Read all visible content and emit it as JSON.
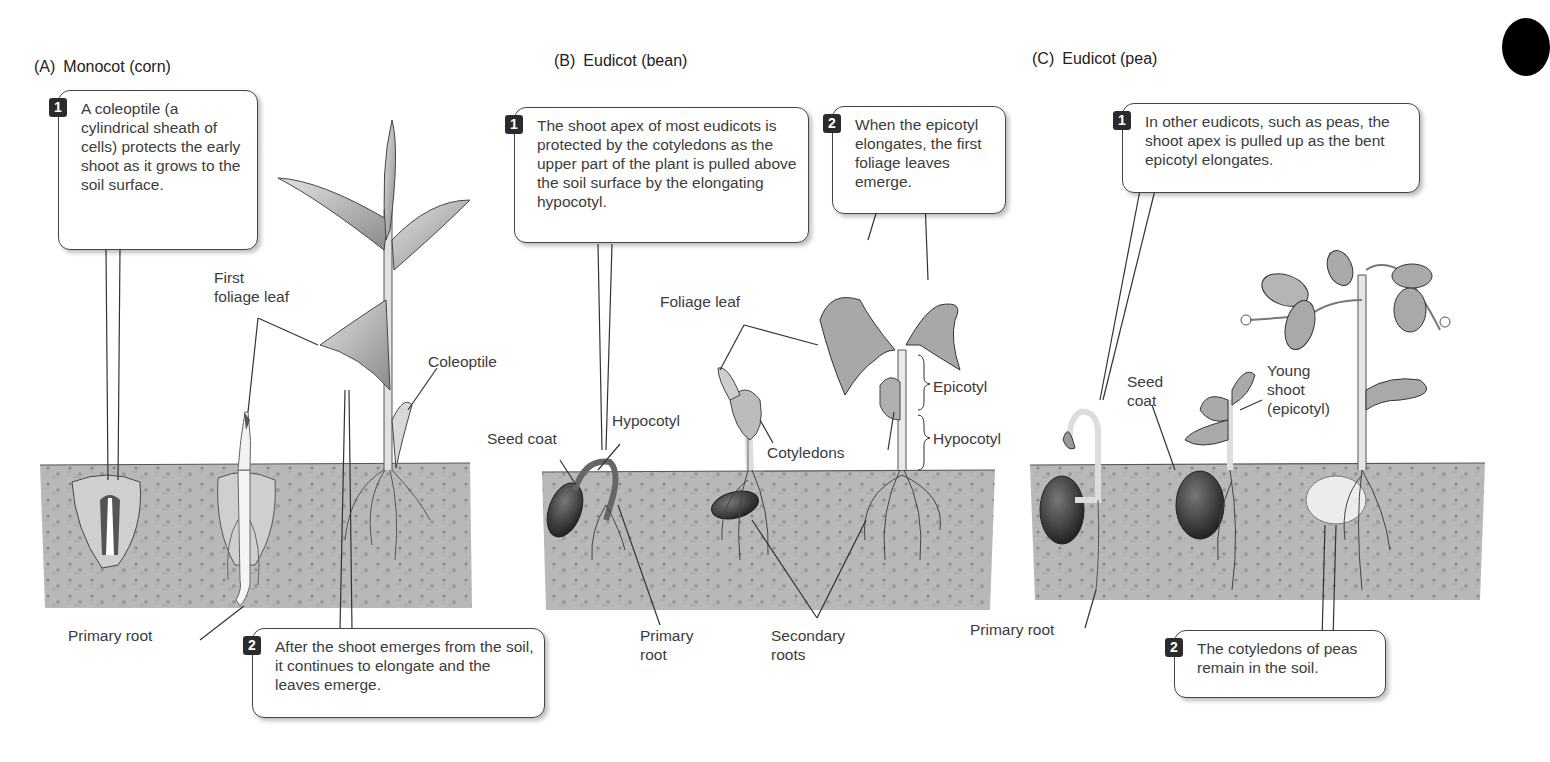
{
  "figure": {
    "panels": [
      {
        "id": "A",
        "letter": "(A)",
        "title": "Monocot (corn)",
        "callouts": [
          {
            "step": "1",
            "text": "A coleoptile (a cylindrical sheath of cells) protects the early shoot as it grows to the soil surface."
          },
          {
            "step": "2",
            "text": "After the shoot emerges from the soil, it continues to elongate and the leaves emerge."
          }
        ],
        "labels": {
          "first_foliage_leaf": "First\nfoliage leaf",
          "first_foliage_leaf_l1": "First",
          "first_foliage_leaf_l2": "foliage leaf",
          "coleoptile": "Coleoptile",
          "primary_root": "Primary root"
        }
      },
      {
        "id": "B",
        "letter": "(B)",
        "title": "Eudicot (bean)",
        "callouts": [
          {
            "step": "1",
            "text": "The shoot apex of most eudicots is protected by the cotyledons as the upper part of the plant is pulled above the soil surface by the elongating hypocotyl."
          },
          {
            "step": "2",
            "text": "When the epicotyl elongates, the first foliage leaves emerge."
          }
        ],
        "labels": {
          "foliage_leaf": "Foliage leaf",
          "hypocotyl": "Hypocotyl",
          "seed_coat": "Seed coat",
          "cotyledons": "Cotyledons",
          "epicotyl_bracket": "Epicotyl",
          "hypocotyl_bracket": "Hypocotyl",
          "primary_root_l1": "Primary",
          "primary_root_l2": "root",
          "secondary_roots_l1": "Secondary",
          "secondary_roots_l2": "roots"
        }
      },
      {
        "id": "C",
        "letter": "(C)",
        "title": "Eudicot (pea)",
        "callouts": [
          {
            "step": "1",
            "text": "In other eudicots, such as peas, the shoot apex is pulled up as the bent epicotyl elongates."
          },
          {
            "step": "2",
            "text": "The cotyledons of peas remain in the soil."
          }
        ],
        "labels": {
          "seed_coat_l1": "Seed",
          "seed_coat_l2": "coat",
          "young_shoot_l1": "Young",
          "young_shoot_l2": "shoot",
          "young_shoot_l3": "(epicotyl)",
          "primary_root": "Primary root"
        }
      }
    ],
    "colors": {
      "soil": "#b9b9b9",
      "badge": "#2b2b2b",
      "text": "#3c3c3c",
      "callout_border": "#444444"
    }
  }
}
